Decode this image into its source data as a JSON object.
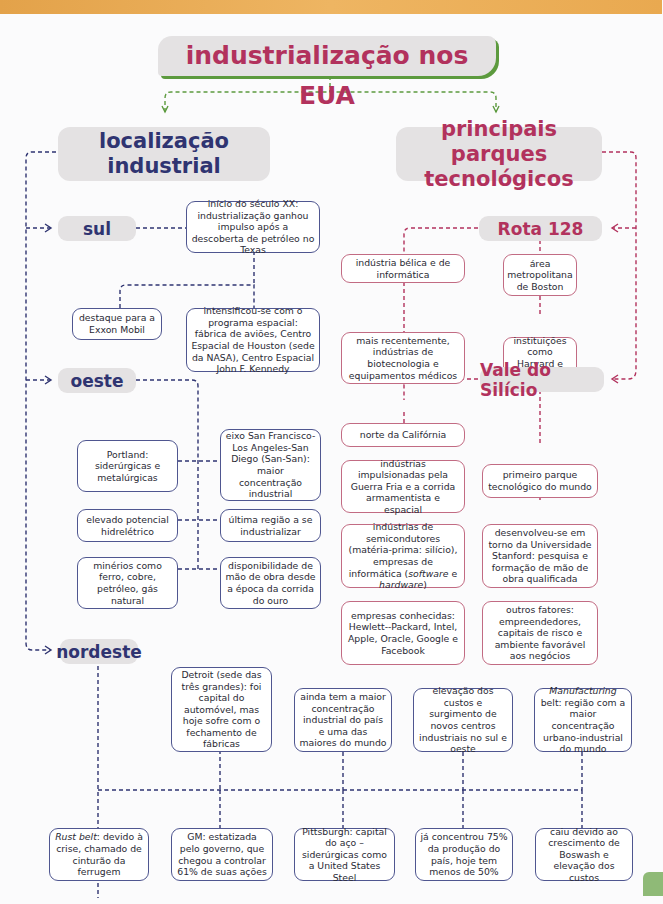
{
  "title": "industrialização nos EUA",
  "colors": {
    "blue": "#2f3471",
    "red": "#b2325d",
    "green": "#5c9a3e",
    "header_bg": "#e4e2e3"
  },
  "left": {
    "heading": "localização industrial",
    "regions": {
      "sul": {
        "label": "sul",
        "boxes": [
          "início do século XX: industrialização ganhou impulso após a descoberta de petróleo no Texas",
          "destaque para a Exxon Mobil",
          "intensificou-se com o programa espacial: fábrica de aviões, Centro Espacial de Houston (sede da NASA), Centro Espacial John F. Kennedy"
        ]
      },
      "oeste": {
        "label": "oeste",
        "boxes": [
          "Portland: siderúrgicas e metalúrgicas",
          "eixo San Francisco-Los Angeles-San Diego (San-San): maior concentração industrial",
          "elevado potencial hidrelétrico",
          "última região a se industrializar",
          "minérios como ferro, cobre, petróleo, gás natural",
          "disponibilidade de mão de obra desde a época da corrida do ouro"
        ]
      },
      "nordeste": {
        "label": "nordeste",
        "top_boxes": [
          "Detroit (sede das três grandes): foi capital do automóvel, mas hoje sofre com o fechamento de fábricas",
          "ainda tem a maior concentração industrial do país e uma das maiores do mundo",
          "elevação dos custos e surgimento de novos centros industriais no sul e oeste",
          "belt: região com a maior concentração urbano-industrial do mundo"
        ],
        "top_box_4_italic": "Manufacturing",
        "bottom_boxes": [
          ": devido à crise, chamado de cinturão da ferrugem",
          "GM: estatizada pelo governo, que chegou a controlar 61% de suas ações",
          "Pittsburgh: capital do aço – siderúrgicas como a United States Steel",
          "já concentrou 75% da produção do país, hoje tem menos de 50%",
          "caiu devido ao crescimento de Boswash e elevação dos custos"
        ],
        "bottom_box_1_italic": "Rust belt"
      }
    }
  },
  "right": {
    "heading": "principais parques tecnológicos",
    "rota128": {
      "label": "Rota 128",
      "boxes": [
        "indústria bélica e de informática",
        "mais recentemente, indústrias de biotecnologia e equipamentos médicos",
        "área metropolitana de Boston",
        "instituições como Harvard e MIT"
      ]
    },
    "vale": {
      "label": "Vale do Silício",
      "left_boxes": [
        "norte da Califórnia",
        "indústrias impulsionadas pela Guerra Fria e a corrida armamentista e espacial",
        "indústrias de semicondutores (matéria-prima: silício), empresas de informática (",
        "empresas conhecidas: Hewlett--Packard, Intel, Apple, Oracle, Google e Facebook"
      ],
      "semis_italic_1": "software",
      "semis_mid": " e ",
      "semis_italic_2": "hardware",
      "semis_end": ")",
      "right_boxes": [
        "primeiro parque tecnológico do mundo",
        "desenvolveu-se em torno da Universidade Stanford: pesquisa e formação de mão de obra qualificada",
        "outros fatores: empreendedores, capitais de risco e ambiente favorável aos negócios"
      ]
    }
  }
}
